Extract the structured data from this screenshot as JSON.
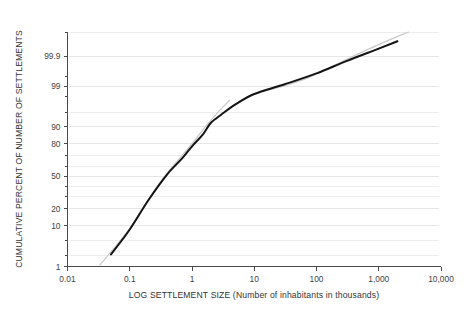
{
  "chart_data": {
    "type": "line",
    "title": "",
    "subtitle": "",
    "xlabel": "LOG SETTLEMENT SIZE (Number of inhabitants in thousands)",
    "ylabel": "CUMULATIVE PERCENT OF NUMBER OF SETTLEMENTS",
    "x_scale": "log10",
    "y_scale": "probit (normal probability)",
    "xlim": [
      0.01,
      10000
    ],
    "ylim": [
      1,
      99.99
    ],
    "grid": true,
    "grid_axis": "y",
    "legend": "none",
    "x_ticks": [
      {
        "value": 0.01,
        "label": "0.01"
      },
      {
        "value": 0.1,
        "label": "0.1"
      },
      {
        "value": 1,
        "label": "1"
      },
      {
        "value": 10,
        "label": "10"
      },
      {
        "value": 100,
        "label": "100"
      },
      {
        "value": 1000,
        "label": "1,000"
      },
      {
        "value": 10000,
        "label": "10,000"
      }
    ],
    "y_ticks": [
      {
        "value": 99.9,
        "label": "99.9"
      },
      {
        "value": 99,
        "label": "99"
      },
      {
        "value": 90,
        "label": "90"
      },
      {
        "value": 80,
        "label": "80"
      },
      {
        "value": 50,
        "label": "50"
      },
      {
        "value": 20,
        "label": "20"
      },
      {
        "value": 10,
        "label": "10"
      },
      {
        "value": 1,
        "label": "1"
      }
    ],
    "y_minor_ticks": [
      99.99,
      99.5,
      98,
      95,
      70,
      60,
      40,
      30,
      5,
      2
    ],
    "y_gridlines": [
      99.99,
      99.9,
      99,
      95,
      90,
      80,
      70,
      60,
      50,
      40,
      30,
      20,
      10,
      5,
      2,
      1
    ],
    "series": [
      {
        "name": "Cumulative settlement size distribution",
        "color": "#141414",
        "style": "solid",
        "points": [
          {
            "x": 0.05,
            "y": 2.2
          },
          {
            "x": 0.1,
            "y": 8.5
          },
          {
            "x": 0.2,
            "y": 27
          },
          {
            "x": 0.4,
            "y": 52
          },
          {
            "x": 0.7,
            "y": 68
          },
          {
            "x": 1.0,
            "y": 78
          },
          {
            "x": 1.5,
            "y": 86
          },
          {
            "x": 2.0,
            "y": 91.5
          },
          {
            "x": 3.0,
            "y": 94.5
          },
          {
            "x": 5.0,
            "y": 96.8
          },
          {
            "x": 10,
            "y": 98.3
          },
          {
            "x": 30,
            "y": 99.1
          },
          {
            "x": 100,
            "y": 99.6
          },
          {
            "x": 300,
            "y": 99.85
          },
          {
            "x": 1000,
            "y": 99.95
          },
          {
            "x": 2000,
            "y": 99.975
          }
        ]
      },
      {
        "name": "Lognormal reference line",
        "color": "#c9c9c9",
        "style": "solid",
        "segments": [
          [
            {
              "x": 0.033,
              "y": 1.1
            },
            {
              "x": 0.1,
              "y": 9.0
            },
            {
              "x": 0.3,
              "y": 43
            },
            {
              "x": 1.0,
              "y": 80
            },
            {
              "x": 2.0,
              "y": 92.5
            },
            {
              "x": 4.0,
              "y": 97.5
            }
          ],
          [
            {
              "x": 10,
              "y": 98.3
            },
            {
              "x": 60,
              "y": 99.35
            },
            {
              "x": 300,
              "y": 99.87
            },
            {
              "x": 1200,
              "y": 99.972
            },
            {
              "x": 3000,
              "y": 99.99
            }
          ]
        ]
      }
    ]
  }
}
